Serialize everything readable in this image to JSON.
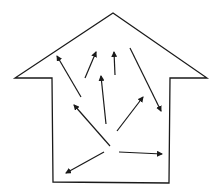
{
  "diagram": {
    "type": "house-outline-with-arrows",
    "stroke_color": "#1a1a1a",
    "background": "#ffffff",
    "house_outline": [
      [
        113,
        13
      ],
      [
        207,
        78
      ],
      [
        170,
        78
      ],
      [
        169,
        183
      ],
      [
        53,
        182
      ],
      [
        52,
        78
      ],
      [
        15,
        78
      ]
    ],
    "arrows": [
      {
        "from": [
          81,
          97
        ],
        "to": [
          57,
          56
        ]
      },
      {
        "from": [
          85,
          78
        ],
        "to": [
          96,
          52
        ]
      },
      {
        "from": [
          115,
          75
        ],
        "to": [
          114,
          52
        ]
      },
      {
        "from": [
          130,
          48
        ],
        "to": [
          161,
          111
        ]
      },
      {
        "from": [
          106,
          124
        ],
        "to": [
          101,
          76
        ]
      },
      {
        "from": [
          117,
          131
        ],
        "to": [
          143,
          97
        ]
      },
      {
        "from": [
          110,
          146
        ],
        "to": [
          74,
          105
        ]
      },
      {
        "from": [
          119,
          152
        ],
        "to": [
          162,
          154
        ]
      },
      {
        "from": [
          104,
          152
        ],
        "to": [
          66,
          173
        ]
      }
    ]
  }
}
